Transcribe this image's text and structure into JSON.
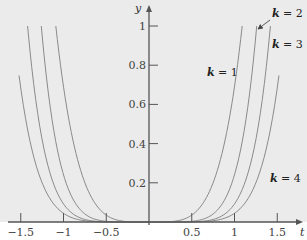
{
  "chart_data": {
    "type": "line",
    "title": "",
    "xlabel": "t",
    "ylabel": "y",
    "xlim": [
      -1.75,
      1.8
    ],
    "ylim": [
      0,
      1.08
    ],
    "grid": false,
    "x_ticks": [
      -1.5,
      -1,
      -0.5,
      0.5,
      1,
      1.5
    ],
    "x_tick_labels": [
      "−1.5",
      "−1",
      "−0.5",
      "0.5",
      "1",
      "1.5"
    ],
    "y_ticks": [
      0.2,
      0.4,
      0.6,
      0.8,
      1
    ],
    "y_tick_labels": [
      "0.2",
      "0.4",
      "0.6",
      "0.8",
      "1"
    ],
    "colors": {
      "plot_bg": "#ebebeb",
      "page_bg": "#ffffff",
      "axis": "#555555",
      "curve": "#8a8a8a",
      "text": "#444444"
    },
    "series": [
      {
        "name": "k = 1",
        "k": 1,
        "shape": "y = (|t|/a)^n",
        "a": 1.09,
        "n": 4.3,
        "t_max": 1.09,
        "points": [
          [
            -1.09,
            1.0
          ],
          [
            -1.0,
            0.69
          ],
          [
            -0.9,
            0.44
          ],
          [
            -0.75,
            0.2
          ],
          [
            -0.6,
            0.077
          ],
          [
            -0.4,
            0.013
          ],
          [
            -0.2,
            0.0007
          ],
          [
            0,
            0
          ],
          [
            0.2,
            0.0007
          ],
          [
            0.4,
            0.013
          ],
          [
            0.6,
            0.077
          ],
          [
            0.75,
            0.2
          ],
          [
            0.9,
            0.44
          ],
          [
            1.0,
            0.69
          ],
          [
            1.09,
            1.0
          ]
        ]
      },
      {
        "name": "k = 2",
        "k": 2,
        "shape": "y = (|t|/a)^n",
        "a": 1.26,
        "n": 6.16,
        "t_max": 1.26,
        "points": [
          [
            -1.26,
            1.0
          ],
          [
            -1.15,
            0.57
          ],
          [
            -0.97,
            0.2
          ],
          [
            -0.8,
            0.061
          ],
          [
            -0.6,
            0.01
          ],
          [
            -0.4,
            0.0008
          ],
          [
            0,
            0
          ],
          [
            0.4,
            0.0008
          ],
          [
            0.6,
            0.01
          ],
          [
            0.8,
            0.061
          ],
          [
            0.97,
            0.2
          ],
          [
            1.15,
            0.57
          ],
          [
            1.26,
            1.0
          ]
        ]
      },
      {
        "name": "k = 3",
        "k": 3,
        "shape": "y = (|t|/a)^n",
        "a": 1.42,
        "n": 6.8,
        "t_max": 1.42,
        "points": [
          [
            -1.42,
            1.0
          ],
          [
            -1.3,
            0.55
          ],
          [
            -1.12,
            0.2
          ],
          [
            -0.95,
            0.065
          ],
          [
            -0.75,
            0.013
          ],
          [
            -0.5,
            0.0008
          ],
          [
            0,
            0
          ],
          [
            0.5,
            0.0008
          ],
          [
            0.75,
            0.013
          ],
          [
            0.95,
            0.065
          ],
          [
            1.12,
            0.2
          ],
          [
            1.3,
            0.55
          ],
          [
            1.42,
            1.0
          ]
        ]
      },
      {
        "name": "k = 4",
        "k": 4,
        "shape": "y = (|t|/a)^n",
        "a": 1.587,
        "n": 6.75,
        "t_max": 1.52,
        "points": [
          [
            -1.52,
            0.75
          ],
          [
            -1.4,
            0.43
          ],
          [
            -1.25,
            0.2
          ],
          [
            -1.05,
            0.061
          ],
          [
            -0.85,
            0.015
          ],
          [
            -0.6,
            0.0014
          ],
          [
            0,
            0
          ],
          [
            0.6,
            0.0014
          ],
          [
            0.85,
            0.015
          ],
          [
            1.05,
            0.061
          ],
          [
            1.25,
            0.2
          ],
          [
            1.4,
            0.43
          ],
          [
            1.52,
            0.75
          ]
        ]
      }
    ],
    "annotations": [
      {
        "text_var": "k",
        "text_rest": " = 1",
        "x": 207,
        "y": 76
      },
      {
        "text_var": "k",
        "text_rest": " = 2",
        "x": 272,
        "y": 17,
        "arrow_from": [
          270,
          20
        ],
        "arrow_to": [
          258,
          29
        ]
      },
      {
        "text_var": "k",
        "text_rest": " = 3",
        "x": 272,
        "y": 48
      },
      {
        "text_var": "k",
        "text_rest": " = 4",
        "x": 270,
        "y": 182
      }
    ]
  }
}
